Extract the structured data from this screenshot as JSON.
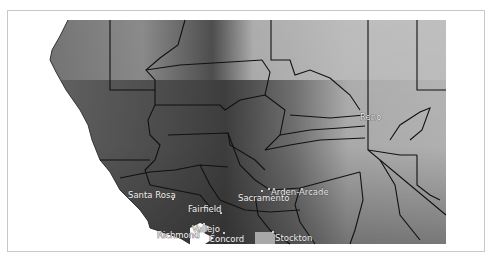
{
  "map": {
    "type": "grayscale elevation relief map with county boundaries",
    "region": "Northern California / Sacramento Valley",
    "colors": {
      "frame_border": "#c8c8c8",
      "boundary": "#111111",
      "lowland": "#2a2a2a",
      "highland": "#d8d8d8",
      "water": "#ffffff"
    },
    "cities": [
      {
        "name": "Reno",
        "x": 372,
        "y": 118
      },
      {
        "name": "Santa Rosa",
        "x": 172,
        "y": 199
      },
      {
        "name": "Fairfield",
        "x": 220,
        "y": 213
      },
      {
        "name": "Sacramento",
        "x": 262,
        "y": 191
      },
      {
        "name": "Arden-Arcade",
        "x": 269,
        "y": 189
      },
      {
        "name": "Vallejo",
        "x": 202,
        "y": 225
      },
      {
        "name": "Richmond",
        "x": 195,
        "y": 234
      },
      {
        "name": "Concord",
        "x": 224,
        "y": 233
      },
      {
        "name": "Stockton",
        "x": 273,
        "y": 232
      }
    ]
  }
}
